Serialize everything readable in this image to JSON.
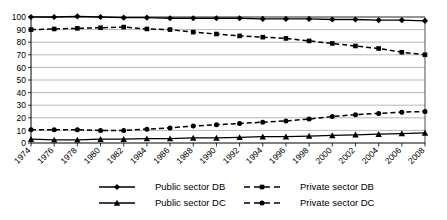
{
  "chart_data": {
    "type": "line",
    "title": "",
    "subtitle": "",
    "xlabel": "",
    "ylabel": "",
    "xlim": [
      1974,
      2008
    ],
    "ylim": [
      0,
      100
    ],
    "ytick_step": 10,
    "grid": true,
    "legend_position": "bottom",
    "x": [
      1974,
      1976,
      1978,
      1980,
      1982,
      1984,
      1986,
      1988,
      1990,
      1992,
      1994,
      1996,
      1998,
      2000,
      2002,
      2004,
      2006,
      2008
    ],
    "xticklabels": [
      "1974",
      "1976",
      "1978",
      "1980",
      "1982",
      "1984",
      "1986",
      "1988",
      "1990",
      "1992",
      "1994",
      "1996",
      "1998",
      "2000",
      "2002",
      "2004",
      "2006",
      "2008"
    ],
    "yticklabels": [
      "0",
      "10",
      "20",
      "30",
      "40",
      "50",
      "60",
      "70",
      "80",
      "90",
      "100"
    ],
    "yticks": [
      0,
      10,
      20,
      30,
      40,
      50,
      60,
      70,
      80,
      90,
      100
    ],
    "series": [
      {
        "name": "Public sector DB",
        "marker": "diamond",
        "linestyle": "solid",
        "color": "#000000",
        "values": [
          100,
          100,
          100.5,
          100,
          99.5,
          99.5,
          99,
          99,
          99,
          99,
          98.5,
          98.5,
          98.5,
          98,
          98,
          97.5,
          97.5,
          97
        ]
      },
      {
        "name": "Private sector DB",
        "marker": "square",
        "linestyle": "dashed",
        "color": "#000000",
        "values": [
          90,
          90.5,
          91,
          91.5,
          92,
          90.5,
          90,
          88,
          86.5,
          85,
          84,
          83,
          81,
          79,
          77,
          75,
          72,
          70
        ]
      },
      {
        "name": "Public sector DC",
        "marker": "triangle",
        "linestyle": "solid",
        "color": "#000000",
        "values": [
          3,
          2.5,
          2.5,
          3,
          3,
          3.5,
          3.5,
          4,
          4,
          4.5,
          5,
          5,
          5.5,
          6,
          6.5,
          7,
          7.5,
          8
        ]
      },
      {
        "name": "Private sector DC",
        "marker": "circle",
        "linestyle": "dashed",
        "color": "#000000",
        "values": [
          10.5,
          10.5,
          10.5,
          10,
          10,
          11,
          12,
          13.5,
          14.5,
          15.5,
          16.5,
          17.5,
          19,
          21,
          22.5,
          23.5,
          24.5,
          25
        ]
      }
    ],
    "legend": [
      {
        "label": "Public sector DB",
        "marker": "diamond",
        "linestyle": "solid"
      },
      {
        "label": "Private sector DB",
        "marker": "square",
        "linestyle": "dashed"
      },
      {
        "label": "Public sector DC",
        "marker": "triangle",
        "linestyle": "solid"
      },
      {
        "label": "Private sector DC",
        "marker": "circle",
        "linestyle": "dashed"
      }
    ]
  }
}
